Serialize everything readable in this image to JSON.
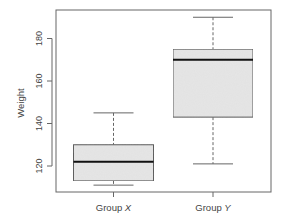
{
  "chart_data": {
    "type": "box",
    "title": "",
    "xlabel": "",
    "ylabel": "Weight",
    "ylim": [
      106,
      193
    ],
    "yticks": [
      120,
      140,
      160,
      180
    ],
    "ytick_labels": [
      "120",
      "140",
      "160",
      "180"
    ],
    "grid": false,
    "legend": null,
    "categories": [
      "Group X",
      "Group Y"
    ],
    "category_display": [
      {
        "prefix": "Group ",
        "italic": "X"
      },
      {
        "prefix": "Group ",
        "italic": "Y"
      }
    ],
    "series": [
      {
        "name": "Group X",
        "whisker_low": 111,
        "q1": 113,
        "median": 122,
        "q3": 130,
        "whisker_high": 145
      },
      {
        "name": "Group Y",
        "whisker_low": 121,
        "q1": 143,
        "median": 170,
        "q3": 175,
        "whisker_high": 190
      }
    ],
    "colors": {
      "box_fill": "#e6e6e6",
      "box_stroke": "#555555",
      "median": "#111111",
      "whisker": "#666666",
      "frame": "#666666",
      "text": "#444444"
    }
  }
}
